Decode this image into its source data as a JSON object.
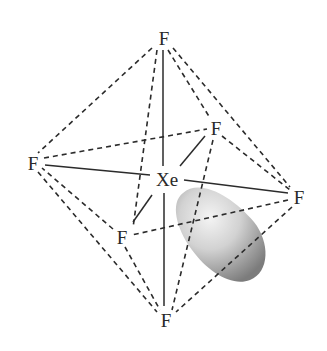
{
  "diagram": {
    "title": "",
    "central_atom": {
      "label": "Xe",
      "x": 167,
      "y": 179
    },
    "ligands": [
      {
        "id": "top",
        "label": "F",
        "x": 164,
        "y": 38
      },
      {
        "id": "left",
        "label": "F",
        "x": 33,
        "y": 163
      },
      {
        "id": "right",
        "label": "F",
        "x": 299,
        "y": 197
      },
      {
        "id": "bottom",
        "label": "F",
        "x": 166,
        "y": 320
      },
      {
        "id": "back-right",
        "label": "F",
        "x": 216,
        "y": 128
      },
      {
        "id": "front-left",
        "label": "F",
        "x": 122,
        "y": 237
      }
    ],
    "lone_pair": {
      "shape": "ellipsoid",
      "color_light": "#f2f2f2",
      "color_dark": "#7a7a7a"
    },
    "colors": {
      "line": "#2b2b2b",
      "text": "#2a2a2a",
      "background": "#ffffff"
    }
  }
}
